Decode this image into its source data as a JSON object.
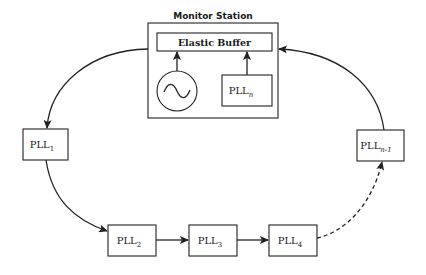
{
  "diagram": {
    "monitor_station": {
      "title": "Monitor Station",
      "elastic_buffer": "Elastic Buffer",
      "oscillator_icon": "sine-wave-oscillator",
      "pll_n": {
        "base": "PLL",
        "sub": "n"
      }
    },
    "nodes": [
      {
        "id": "pll1",
        "base": "PLL",
        "sub": "1"
      },
      {
        "id": "pll2",
        "base": "PLL",
        "sub": "2"
      },
      {
        "id": "pll3",
        "base": "PLL",
        "sub": "3"
      },
      {
        "id": "pll4",
        "base": "PLL",
        "sub": "4"
      },
      {
        "id": "plln1",
        "base": "PLL",
        "sub": "n-1"
      }
    ],
    "edges": [
      {
        "from": "monitor_station",
        "to": "pll1",
        "style": "solid"
      },
      {
        "from": "pll1",
        "to": "pll2",
        "style": "solid"
      },
      {
        "from": "pll2",
        "to": "pll3",
        "style": "solid"
      },
      {
        "from": "pll3",
        "to": "pll4",
        "style": "solid"
      },
      {
        "from": "pll4",
        "to": "plln1",
        "style": "dashed"
      },
      {
        "from": "plln1",
        "to": "monitor_station",
        "style": "solid"
      },
      {
        "from": "oscillator",
        "to": "elastic_buffer",
        "style": "solid"
      },
      {
        "from": "pll_n",
        "to": "elastic_buffer",
        "style": "solid"
      }
    ]
  }
}
